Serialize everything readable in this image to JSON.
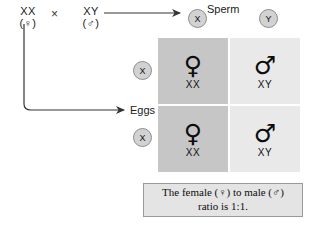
{
  "diagram": {
    "title_visible": false,
    "parents": [
      {
        "genotype": "XX",
        "sex_symbol": "(♀)",
        "role": "female-parent"
      },
      {
        "genotype": "XY",
        "sex_symbol": "(♂)",
        "role": "male-parent"
      }
    ],
    "cross_symbol": "×",
    "gamete_labels": {
      "sperm": "Sperm",
      "eggs": "Eggs"
    },
    "sperm_gametes": [
      {
        "allele": "X"
      },
      {
        "allele": "Y"
      }
    ],
    "egg_gametes": [
      {
        "allele": "X"
      },
      {
        "allele": "X"
      }
    ],
    "punnett_cells": [
      {
        "symbol": "♀",
        "genotype": "XX",
        "shade": "dark"
      },
      {
        "symbol": "♂",
        "genotype": "XY",
        "shade": "light"
      },
      {
        "symbol": "♀",
        "genotype": "XX",
        "shade": "dark"
      },
      {
        "symbol": "♂",
        "genotype": "XY",
        "shade": "light"
      }
    ],
    "caption": {
      "line1": "The female (♀) to male (♂)",
      "line2": "ratio is 1:1."
    },
    "colors": {
      "cell_dark": "#c6c6c6",
      "cell_light": "#e9e9e9",
      "gamete_fill": "#d2d2d2",
      "gamete_border": "#8d8d8d",
      "caption_fill": "#e4e4e4",
      "caption_border": "#9a9a9a",
      "arrow_stroke": "#333333",
      "background": "#ffffff"
    }
  }
}
